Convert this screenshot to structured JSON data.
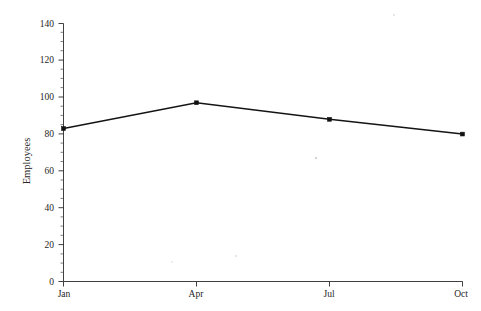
{
  "chart_data": {
    "type": "line",
    "title": "",
    "subtitle": "",
    "xlabel": "",
    "ylabel": "Employees",
    "categories": [
      "Jan",
      "Apr",
      "Jul",
      "Oct"
    ],
    "values": [
      83,
      97,
      88,
      80
    ],
    "series": [
      {
        "name": "Employees",
        "values": [
          83,
          97,
          88,
          80
        ],
        "color": "#141414",
        "marker": "square"
      }
    ],
    "ylim": [
      0,
      140
    ],
    "xlim": [
      "Jan",
      "Oct"
    ],
    "y_major_ticks": [
      0,
      20,
      40,
      60,
      80,
      100,
      120,
      140
    ],
    "y_tick_labels": [
      "0",
      "20",
      "40",
      "60",
      "80",
      "100",
      "120",
      "140"
    ],
    "y_minor_tick_step": 5,
    "x_tick_labels": [
      "Jan",
      "Apr",
      "Jul",
      "Oct"
    ],
    "grid": false,
    "legend": false,
    "legend_position": "none",
    "annotations": []
  },
  "figure": {
    "background_color": "#ffffff",
    "axis_color": "#2b2b2b",
    "line_color": "#141414"
  }
}
